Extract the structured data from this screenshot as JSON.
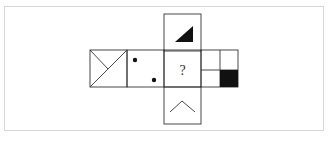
{
  "diagram": {
    "type": "cube-net-puzzle",
    "question_mark": "?",
    "faces": [
      {
        "id": "left",
        "content": "square with X-like lines (diagonal from bottom-left to top-right and line from top-left to center)"
      },
      {
        "id": "dots",
        "content": "two black dots, upper-left and lower-right"
      },
      {
        "id": "top",
        "content": "black right triangle in lower-right"
      },
      {
        "id": "center",
        "content": "question mark"
      },
      {
        "id": "bottom",
        "content": "caret / chevron-up shape"
      },
      {
        "id": "right",
        "content": "square divided into four quadrants, bottom-right filled black"
      }
    ],
    "colors": {
      "stroke": "#333333",
      "fill": "#111111",
      "frame": "#d6d6d6",
      "background": "#ffffff"
    }
  }
}
